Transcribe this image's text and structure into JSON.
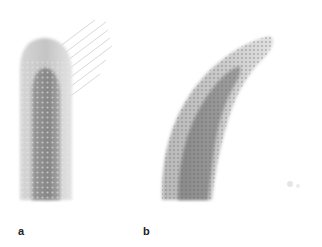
{
  "figure": {
    "panels": [
      {
        "id": "a",
        "label": "a",
        "description": "straight tubular tip with fibrous strands emerging at top right"
      },
      {
        "id": "b",
        "label": "b",
        "description": "curved tapering tip with dotted surface texture"
      }
    ]
  },
  "colors": {
    "background": "#ffffff",
    "outer": "#cfcfcf",
    "inner": "#8e8e8e",
    "dots": "#6a6a6a",
    "strands": "#d8d8d8"
  }
}
